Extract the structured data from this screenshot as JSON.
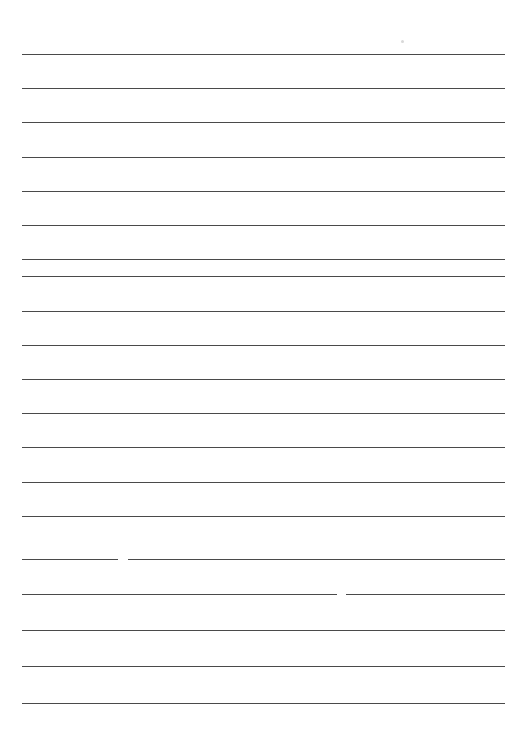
{
  "document": {
    "title": "Lined Paper",
    "type": "blank-ruled-sheet",
    "page_width": 525,
    "page_height": 729,
    "background_color": "#ffffff",
    "rule_color": "#4a4a4a",
    "rule_thickness_px": 1,
    "rule_left_x": 22,
    "rule_right_x": 505,
    "rule_count": 20,
    "first_rule_y": 54,
    "rule_spacing_px": 34.2,
    "text_content": "",
    "header_text": "",
    "footer_text": "",
    "margin_rule": "none"
  },
  "rules": [
    {
      "index": 1,
      "y": 54,
      "x1": 22,
      "x2": 505,
      "broken": false
    },
    {
      "index": 2,
      "y": 88,
      "x1": 22,
      "x2": 505,
      "broken": false
    },
    {
      "index": 3,
      "y": 122,
      "x1": 22,
      "x2": 505,
      "broken": false
    },
    {
      "index": 4,
      "y": 157,
      "x1": 22,
      "x2": 505,
      "broken": false
    },
    {
      "index": 5,
      "y": 191,
      "x1": 22,
      "x2": 505,
      "broken": false
    },
    {
      "index": 6,
      "y": 225,
      "x1": 22,
      "x2": 505,
      "broken": false
    },
    {
      "index": 7,
      "y": 259,
      "x1": 22,
      "x2": 505,
      "broken": false
    },
    {
      "index": 8,
      "y": 276,
      "x1": 22,
      "x2": 505,
      "broken": false
    },
    {
      "index": 9,
      "y": 311,
      "x1": 22,
      "x2": 505,
      "broken": false
    },
    {
      "index": 10,
      "y": 345,
      "x1": 22,
      "x2": 505,
      "broken": false
    },
    {
      "index": 11,
      "y": 379,
      "x1": 22,
      "x2": 505,
      "broken": false
    },
    {
      "index": 12,
      "y": 413,
      "x1": 22,
      "x2": 505,
      "broken": false
    },
    {
      "index": 13,
      "y": 447,
      "x1": 22,
      "x2": 505,
      "broken": false
    },
    {
      "index": 14,
      "y": 482,
      "x1": 22,
      "x2": 505,
      "broken": false
    },
    {
      "index": 15,
      "y": 516,
      "x1": 22,
      "x2": 505,
      "broken": false
    },
    {
      "index": 16,
      "y": 559,
      "x1": 22,
      "x2": 505,
      "broken": true,
      "gap_x1": 118,
      "gap_x2": 128
    },
    {
      "index": 17,
      "y": 594,
      "x1": 22,
      "x2": 505,
      "broken": true,
      "gap_x1": 337,
      "gap_x2": 346
    },
    {
      "index": 18,
      "y": 630,
      "x1": 22,
      "x2": 505,
      "broken": false
    },
    {
      "index": 19,
      "y": 666,
      "x1": 22,
      "x2": 505,
      "broken": false
    },
    {
      "index": 20,
      "y": 703,
      "x1": 22,
      "x2": 505,
      "broken": false
    }
  ],
  "artifacts": [
    {
      "name": "scan-speck",
      "x": 401,
      "y": 40,
      "size": 3
    }
  ]
}
